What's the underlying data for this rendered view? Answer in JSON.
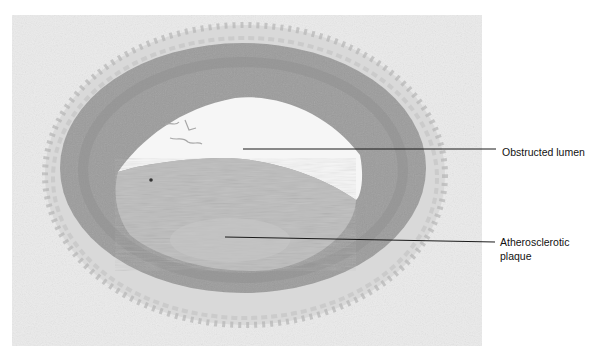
{
  "figure": {
    "colors": {
      "background": "#ffffff",
      "tissue_background": "#ebebeb",
      "connective_tissue": "#dedede",
      "media_wall": "#9a9a9a",
      "plaque": "#bcbcbc",
      "lumen": "#f7f7f7",
      "leader_line": "#1a1a1a"
    },
    "annotations": [
      {
        "id": "lumen",
        "label_lines": [
          "Obstructed lumen"
        ],
        "pointer_from": [
          243,
          149
        ],
        "pointer_to": [
          496,
          149
        ]
      },
      {
        "id": "plaque",
        "label_lines": [
          "Atherosclerotic",
          "plaque"
        ],
        "pointer_from": [
          225,
          237
        ],
        "pointer_to": [
          495,
          242
        ]
      }
    ]
  }
}
